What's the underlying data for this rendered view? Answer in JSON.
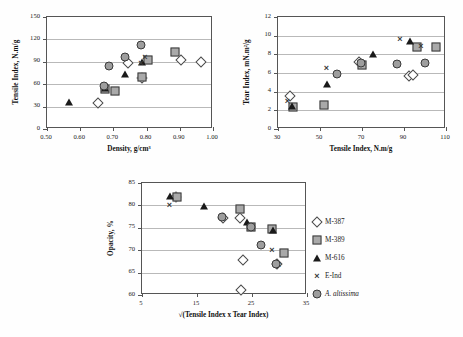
{
  "figure": {
    "legend": {
      "entries": [
        {
          "label": "M-387",
          "marker": "diamond",
          "italic": false
        },
        {
          "label": "M-389",
          "marker": "square",
          "italic": false
        },
        {
          "label": "M-616",
          "marker": "triangle",
          "italic": false
        },
        {
          "label": "E-Ind",
          "marker": "cross",
          "italic": false
        },
        {
          "label": "A. altissima",
          "marker": "circle",
          "italic": true
        }
      ]
    }
  },
  "chart_data": [
    {
      "type": "scatter",
      "title": "",
      "xlabel": "Density, g/cm³",
      "ylabel": "Tensile Index, N.m/g",
      "xlim": [
        0.5,
        1.0
      ],
      "ylim": [
        0,
        150
      ],
      "xticks": [
        "0.50",
        "0.60",
        "0.70",
        "0.80",
        "0.90",
        "1.00"
      ],
      "yticks": [
        "0",
        "30",
        "60",
        "90",
        "120",
        "150"
      ],
      "grid": true,
      "legend_position": "shared-bottom-right",
      "series": [
        {
          "name": "M-387",
          "marker": "diamond",
          "points": [
            [
              0.655,
              35
            ],
            [
              0.745,
              89
            ],
            [
              0.785,
              68
            ],
            [
              0.905,
              92
            ],
            [
              0.965,
              90
            ]
          ]
        },
        {
          "name": "M-389",
          "marker": "square",
          "points": [
            [
              0.675,
              54
            ],
            [
              0.705,
              51
            ],
            [
              0.785,
              69
            ],
            [
              0.805,
              93
            ],
            [
              0.885,
              103
            ]
          ]
        },
        {
          "name": "M-616",
          "marker": "triangle",
          "points": [
            [
              0.565,
              36
            ],
            [
              0.675,
              55
            ],
            [
              0.735,
              74
            ],
            [
              0.785,
              90
            ]
          ]
        },
        {
          "name": "E-Ind",
          "marker": "cross",
          "points": [
            [
              0.675,
              55
            ],
            [
              0.783,
              89
            ],
            [
              0.795,
              97
            ]
          ]
        },
        {
          "name": "A. altissima",
          "marker": "circle",
          "points": [
            [
              0.672,
              57
            ],
            [
              0.688,
              85
            ],
            [
              0.735,
              97
            ],
            [
              0.783,
              113
            ]
          ]
        }
      ]
    },
    {
      "type": "scatter",
      "title": "",
      "xlabel": "Tensile Index, N.m/g",
      "ylabel": "Tear Index, mN.m²/g",
      "xlim": [
        30,
        110
      ],
      "ylim": [
        0,
        12
      ],
      "xticks": [
        "30",
        "50",
        "70",
        "90",
        "110"
      ],
      "yticks": [
        "0",
        "2",
        "4",
        "6",
        "8",
        "10",
        "12"
      ],
      "grid": true,
      "legend_position": "shared-bottom-right",
      "series": [
        {
          "name": "M-387",
          "marker": "diamond",
          "points": [
            [
              35.5,
              3.55
            ],
            [
              68.5,
              7.15
            ],
            [
              92.5,
              5.7
            ],
            [
              94.5,
              5.75
            ]
          ]
        },
        {
          "name": "M-389",
          "marker": "square",
          "points": [
            [
              37,
              2.4
            ],
            [
              52,
              2.55
            ],
            [
              70,
              6.85
            ],
            [
              96,
              8.8
            ],
            [
              105,
              8.8
            ]
          ]
        },
        {
          "name": "M-616",
          "marker": "triangle",
          "points": [
            [
              36.5,
              2.45
            ],
            [
              53.5,
              4.85
            ],
            [
              75,
              8.05
            ],
            [
              93,
              9.4
            ]
          ]
        },
        {
          "name": "E-Ind",
          "marker": "cross",
          "points": [
            [
              34.5,
              2.95
            ],
            [
              53,
              6.5
            ],
            [
              88,
              9.6
            ],
            [
              98,
              8.85
            ]
          ]
        },
        {
          "name": "A. altissima",
          "marker": "circle",
          "points": [
            [
              58,
              5.9
            ],
            [
              69.5,
              7.1
            ],
            [
              86.5,
              7.0
            ],
            [
              100,
              7.1
            ]
          ]
        }
      ]
    },
    {
      "type": "scatter",
      "title": "",
      "xlabel": "√(Tensile Index x Tear Index)",
      "ylabel": "Opacity, %",
      "xlim": [
        5,
        35
      ],
      "ylim": [
        60,
        85
      ],
      "xticks": [
        "5",
        "15",
        "25",
        "35"
      ],
      "yticks": [
        "60",
        "65",
        "70",
        "75",
        "80",
        "85"
      ],
      "grid": true,
      "legend_position": "right",
      "series": [
        {
          "name": "M-387",
          "marker": "diamond",
          "points": [
            [
              11.1,
              81.8
            ],
            [
              19.7,
              77.1
            ],
            [
              22.8,
              77.1
            ],
            [
              23.4,
              67.8
            ],
            [
              23.0,
              61.2
            ],
            [
              29.5,
              66.9
            ]
          ]
        },
        {
          "name": "M-389",
          "marker": "square",
          "points": [
            [
              11.3,
              81.8
            ],
            [
              22.8,
              79.3
            ],
            [
              24.9,
              75.1
            ],
            [
              28.7,
              74.7
            ],
            [
              30.9,
              69.4
            ]
          ]
        },
        {
          "name": "M-616",
          "marker": "triangle",
          "points": [
            [
              10.0,
              82.1
            ],
            [
              16.3,
              79.9
            ],
            [
              24.0,
              76.4
            ],
            [
              28.9,
              74.4
            ]
          ]
        },
        {
          "name": "E-Ind",
          "marker": "cross",
          "points": [
            [
              10.0,
              80.2
            ],
            [
              19.6,
              76.9
            ],
            [
              28.6,
              70.0
            ],
            [
              29.8,
              66.6
            ]
          ]
        },
        {
          "name": "A. altissima",
          "marker": "circle",
          "points": [
            [
              19.6,
              77.3
            ],
            [
              24.8,
              75.1
            ],
            [
              26.6,
              71.1
            ],
            [
              29.4,
              66.9
            ]
          ]
        }
      ]
    }
  ]
}
